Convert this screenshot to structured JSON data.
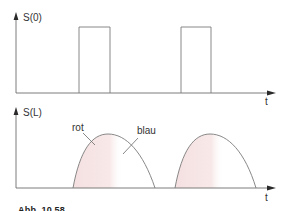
{
  "figure": {
    "top_panel": {
      "y_label": "S(0)",
      "x_label": "t",
      "signal_type": "rectangular pulses",
      "pulses": [
        {
          "x_start": 79,
          "x_end": 110
        },
        {
          "x_start": 181,
          "x_end": 211
        }
      ]
    },
    "bottom_panel": {
      "y_label": "S(L)",
      "x_label": "t",
      "signal_type": "broadened pulses (dispersion)",
      "annotations": [
        {
          "text": "rot",
          "meaning": "leading edge"
        },
        {
          "text": "blau",
          "meaning": "trailing edge"
        }
      ]
    },
    "caption_partial": "Abb. 10.58"
  },
  "colors": {
    "line": "#7a7a7a",
    "axis": "#6e6e6e",
    "fill_red_tint": "#f6e4e4",
    "text": "#333333"
  }
}
